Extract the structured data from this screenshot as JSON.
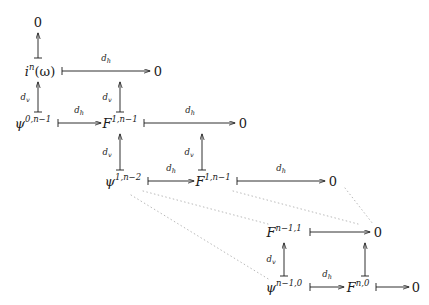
{
  "figure": {
    "kind": "commutative-diagram",
    "background": "#ffffff",
    "ink": "#1a1a1a",
    "dotted_color": "#b9b9b9",
    "labels": {
      "d_h": "d",
      "d_h_sub": "h",
      "d_v": "d",
      "d_v_sub": "v"
    },
    "nodes": [
      {
        "id": "zero-top",
        "text": "0",
        "sup": "",
        "x": 38,
        "y": 22
      },
      {
        "id": "i-n-omega",
        "text": "i",
        "sup": "n",
        "tail": "(ω)",
        "x": 40,
        "y": 71
      },
      {
        "id": "zero-r1",
        "text": "0",
        "sup": "",
        "x": 158,
        "y": 71
      },
      {
        "id": "psi-0-n-1",
        "text": "ψ",
        "sup": "0,n−1",
        "x": 33,
        "y": 123
      },
      {
        "id": "F-1-n-1-r2",
        "text": "F",
        "sup": "1,n−1",
        "x": 120,
        "y": 123
      },
      {
        "id": "zero-r2",
        "text": "0",
        "sup": "",
        "x": 243,
        "y": 123
      },
      {
        "id": "psi-1-n-2",
        "text": "ψ",
        "sup": "1,n−2",
        "x": 123,
        "y": 181
      },
      {
        "id": "F-1-n-1-r3",
        "text": "F",
        "sup": "1,n−1",
        "x": 213,
        "y": 181
      },
      {
        "id": "zero-r3",
        "text": "0",
        "sup": "",
        "x": 333,
        "y": 181
      },
      {
        "id": "F-n-1-1",
        "text": "F",
        "sup": "n−1,1",
        "x": 284,
        "y": 232
      },
      {
        "id": "zero-r4",
        "text": "0",
        "sup": "",
        "x": 378,
        "y": 232
      },
      {
        "id": "psi-n-1-0",
        "text": "ψ",
        "sup": "n−1,0",
        "x": 284,
        "y": 287
      },
      {
        "id": "F-n-0",
        "text": "F",
        "sup": "n,0",
        "x": 358,
        "y": 287
      },
      {
        "id": "zero-r5",
        "text": "0",
        "sup": "",
        "x": 416,
        "y": 287
      }
    ],
    "horizontal_arrows": [
      {
        "id": "h-in-omega-to-zero",
        "label": "d_h",
        "from": "i-n-omega",
        "to": "zero-r1",
        "x1": 62,
        "x2": 150,
        "y": 71,
        "lx": 106,
        "ly": 58,
        "barred": true
      },
      {
        "id": "h-psi0-to-F1",
        "label": "d_h",
        "from": "psi-0-n-1",
        "to": "F-1-n-1-r2",
        "x1": 58,
        "x2": 101,
        "y": 123,
        "lx": 79,
        "ly": 110,
        "barred": true
      },
      {
        "id": "h-F1-to-zero",
        "label": "d_h",
        "from": "F-1-n-1-r2",
        "to": "zero-r2",
        "x1": 144,
        "x2": 235,
        "y": 123,
        "lx": 190,
        "ly": 110,
        "barred": true
      },
      {
        "id": "h-psi1-to-F1b",
        "label": "d_h",
        "from": "psi-1-n-2",
        "to": "F-1-n-1-r3",
        "x1": 148,
        "x2": 194,
        "y": 181,
        "lx": 171,
        "ly": 168,
        "barred": true
      },
      {
        "id": "h-F1b-to-zero",
        "label": "d_h",
        "from": "F-1-n-1-r3",
        "to": "zero-r3",
        "x1": 237,
        "x2": 325,
        "y": 181,
        "lx": 281,
        "ly": 168,
        "barred": true
      },
      {
        "id": "h-Fn11-to-zero",
        "label": "",
        "from": "F-n-1-1",
        "to": "zero-r4",
        "x1": 310,
        "x2": 370,
        "y": 232,
        "lx": 0,
        "ly": 0,
        "barred": true
      },
      {
        "id": "h-psin-to-Fn0",
        "label": "d_h",
        "from": "psi-n-1-0",
        "to": "F-n-0",
        "x1": 310,
        "x2": 344,
        "y": 287,
        "lx": 327,
        "ly": 274,
        "barred": true
      },
      {
        "id": "h-Fn0-to-zero",
        "label": "",
        "from": "F-n-0",
        "to": "zero-r5",
        "x1": 376,
        "x2": 409,
        "y": 287,
        "lx": 0,
        "ly": 0,
        "barred": true
      }
    ],
    "vertical_arrows": [
      {
        "id": "v-inomega-to-zerotop",
        "label": "",
        "x": 38,
        "y1": 58,
        "y2": 33,
        "lx": 0,
        "ly": 0,
        "barred": true
      },
      {
        "id": "v-psi0-to-inomega",
        "label": "d_v",
        "x": 38,
        "y1": 112,
        "y2": 82,
        "lx": 25,
        "ly": 97,
        "barred": true
      },
      {
        "id": "v-F1-to-zero-r1",
        "label": "d_v",
        "x": 120,
        "y1": 112,
        "y2": 82,
        "lx": 107,
        "ly": 97,
        "barred": true
      },
      {
        "id": "v-psi1-to-F1",
        "label": "d_v",
        "x": 120,
        "y1": 170,
        "y2": 134,
        "lx": 107,
        "ly": 152,
        "barred": true
      },
      {
        "id": "v-F1b-to-zero-r2",
        "label": "d_v",
        "x": 202,
        "y1": 170,
        "y2": 134,
        "lx": 189,
        "ly": 152,
        "barred": true
      },
      {
        "id": "v-psin-to-Fn11",
        "label": "d_v",
        "x": 284,
        "y1": 276,
        "y2": 243,
        "lx": 271,
        "ly": 259,
        "barred": true
      },
      {
        "id": "v-Fn0-to-zero-r4",
        "label": "",
        "x": 365,
        "y1": 276,
        "y2": 243,
        "lx": 0,
        "ly": 0,
        "barred": true
      }
    ],
    "ellipsis_lines": [
      {
        "id": "dots-upper",
        "x1": 143,
        "y1": 191,
        "x2": 268,
        "y2": 224
      },
      {
        "id": "dots-middle",
        "x1": 233,
        "y1": 191,
        "x2": 358,
        "y2": 224
      },
      {
        "id": "dots-right",
        "x1": 345,
        "y1": 188,
        "x2": 373,
        "y2": 224
      },
      {
        "id": "dots-lower",
        "x1": 131,
        "y1": 195,
        "x2": 270,
        "y2": 280
      }
    ]
  }
}
